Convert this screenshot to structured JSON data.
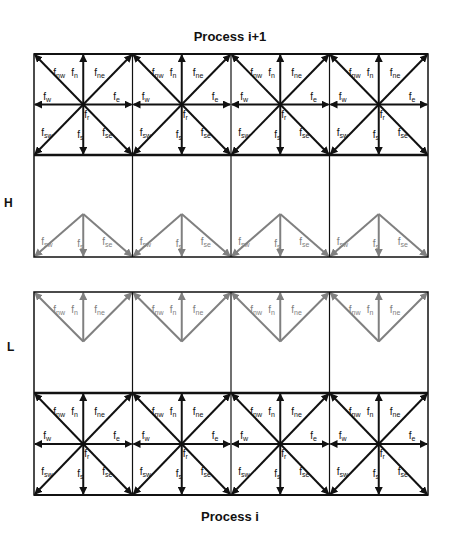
{
  "titles": {
    "top": "Process i+1",
    "bottom": "Process i"
  },
  "side_labels": {
    "upper": "H",
    "lower": "L"
  },
  "colors": {
    "line": "#111111",
    "ghost": "#808080",
    "background": "#ffffff"
  },
  "layout": {
    "left": 34,
    "right": 428,
    "columns": 4,
    "top_grid": {
      "top": 54,
      "mid": 155,
      "bottom": 257
    },
    "bottom_grid": {
      "top": 292,
      "mid": 393,
      "bottom": 495
    }
  },
  "lattice": {
    "full_directions": [
      "nw",
      "n",
      "ne",
      "w",
      "e",
      "sw",
      "s",
      "se"
    ],
    "labels": {
      "nw": "f_nw",
      "n": "f_n",
      "ne": "f_ne",
      "w": "f_w",
      "e": "f_e",
      "sw": "f_sw",
      "s": "f_s",
      "se": "f_se",
      "r": "f_r"
    },
    "ghost_top_directions": [
      "sw",
      "s",
      "se"
    ],
    "ghost_bottom_directions": [
      "nw",
      "n",
      "ne"
    ]
  },
  "sections": [
    {
      "name": "process-i-plus-1-owned-row",
      "grid": "top_grid",
      "row": "upper",
      "type": "full"
    },
    {
      "name": "process-i-plus-1-halo-row-H",
      "grid": "top_grid",
      "row": "lower",
      "type": "ghost-down"
    },
    {
      "name": "process-i-halo-row-L",
      "grid": "bottom_grid",
      "row": "upper",
      "type": "ghost-up"
    },
    {
      "name": "process-i-owned-row",
      "grid": "bottom_grid",
      "row": "lower",
      "type": "full"
    }
  ]
}
